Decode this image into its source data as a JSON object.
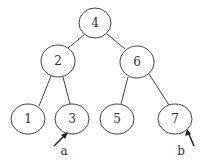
{
  "diagram": {
    "type": "binary-tree",
    "nodes": [
      {
        "id": "n4",
        "label": "4",
        "cx": 95,
        "cy": 24,
        "rx": 16,
        "ry": 15
      },
      {
        "id": "n2",
        "label": "2",
        "cx": 58,
        "cy": 61,
        "rx": 17,
        "ry": 16
      },
      {
        "id": "n6",
        "label": "6",
        "cx": 137,
        "cy": 62,
        "rx": 17,
        "ry": 16
      },
      {
        "id": "n1",
        "label": "1",
        "cx": 28,
        "cy": 119,
        "rx": 17,
        "ry": 15
      },
      {
        "id": "n3",
        "label": "3",
        "cx": 72,
        "cy": 119,
        "rx": 17,
        "ry": 15
      },
      {
        "id": "n5",
        "label": "5",
        "cx": 117,
        "cy": 119,
        "rx": 17,
        "ry": 15
      },
      {
        "id": "n7",
        "label": "7",
        "cx": 175,
        "cy": 119,
        "rx": 17,
        "ry": 15
      }
    ],
    "edges": [
      {
        "from": "4",
        "to": "2"
      },
      {
        "from": "4",
        "to": "6"
      },
      {
        "from": "2",
        "to": "1"
      },
      {
        "from": "2",
        "to": "3"
      },
      {
        "from": "6",
        "to": "5"
      },
      {
        "from": "6",
        "to": "7"
      }
    ],
    "pointers": [
      {
        "label": "a",
        "target": "3"
      },
      {
        "label": "b",
        "target": "7"
      }
    ]
  }
}
